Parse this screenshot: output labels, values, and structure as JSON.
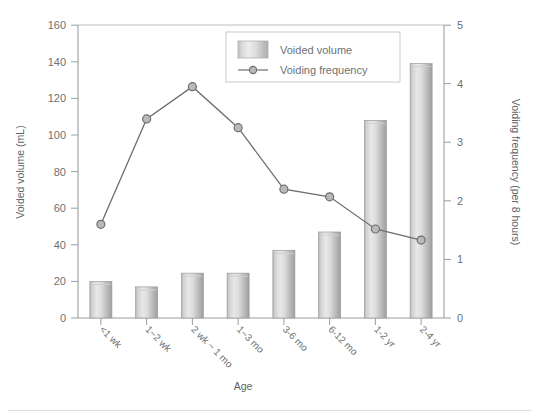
{
  "chart_data": {
    "type": "bar",
    "title": "",
    "subtitle": "",
    "xlabel": "Age",
    "ylabel": "Voided volume (mL)",
    "y2label": "Voiding frequency (per 8 hours)",
    "categories": [
      "<1 wk",
      "1~2 wk",
      "2 wk ~ 1 mo",
      "1~3 mo",
      "3-6 mo",
      "6-12 mo",
      "1-2 yr",
      "2-4 yr"
    ],
    "series": [
      {
        "name": "Voided volume",
        "type": "bar",
        "axis": "left",
        "unit": "mL",
        "values": [
          20,
          17,
          24.5,
          24.5,
          37,
          47,
          108,
          139
        ]
      },
      {
        "name": "Voiding frequency",
        "type": "line",
        "axis": "right",
        "unit": "per 8 hours",
        "values": [
          1.6,
          3.4,
          3.95,
          3.25,
          2.2,
          2.07,
          1.52,
          1.33
        ]
      }
    ],
    "ylim": [
      0,
      160
    ],
    "yticks": [
      0,
      20,
      40,
      60,
      80,
      100,
      120,
      140,
      160
    ],
    "y2lim": [
      0,
      5
    ],
    "y2ticks": [
      0,
      1,
      2,
      3,
      4,
      5
    ],
    "grid": false,
    "legend_position": "top-center",
    "colors": {
      "bar_fill_light": "#e3e3e3",
      "bar_fill_mid": "#c6c6c6",
      "bar_fill_dark": "#a8a8a8",
      "bar_edge": "#9a9a9a",
      "line": "#6b6f72",
      "marker_fill": "#b9b9b9",
      "marker_edge": "#6b6f72",
      "axis": "#9a9ea0",
      "text": "#6d7173",
      "legend_border": "#c9c9c9",
      "background": "#ffffff"
    }
  },
  "legend": {
    "items": [
      {
        "label": "Voided volume",
        "marker": "bar-swatch"
      },
      {
        "label": "Voiding frequency",
        "marker": "line-circle-marker"
      }
    ]
  },
  "axes": {
    "left": {
      "title": "Voided volume (mL)",
      "ticks": [
        "0",
        "20",
        "40",
        "60",
        "80",
        "100",
        "120",
        "140",
        "160"
      ]
    },
    "right": {
      "title": "Voiding frequency (per 8 hours)",
      "ticks": [
        "0",
        "1",
        "2",
        "3",
        "4",
        "5"
      ]
    },
    "bottom": {
      "title": "Age",
      "ticks": [
        "<1 wk",
        "1~2 wk",
        "2 wk ~ 1 mo",
        "1~3 mo",
        "3-6 mo",
        "6-12 mo",
        "1-2 yr",
        "2-4 yr"
      ]
    }
  }
}
